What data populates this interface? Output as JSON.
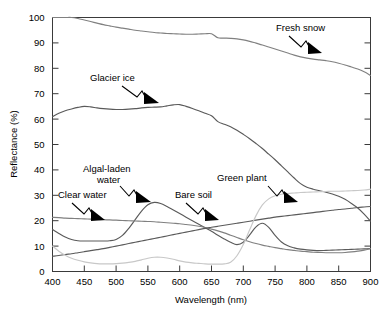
{
  "chart_data": {
    "type": "line",
    "title": "",
    "xlabel": "Wavelength (nm)",
    "ylabel": "Reflectance (%)",
    "xlim": [
      400,
      900
    ],
    "ylim": [
      0,
      100
    ],
    "xticks": [
      400,
      450,
      500,
      550,
      600,
      650,
      700,
      750,
      800,
      850,
      900
    ],
    "yticks": [
      0,
      10,
      20,
      30,
      40,
      50,
      60,
      70,
      80,
      90,
      100
    ],
    "xtick_labels": [
      "400",
      "450",
      "500",
      "550",
      "600",
      "650",
      "700",
      "750",
      "800",
      "850",
      "900"
    ],
    "ytick_labels": [
      "0",
      "10",
      "20",
      "30",
      "40",
      "50",
      "60",
      "70",
      "80",
      "90",
      "100"
    ],
    "grid": false,
    "legend_position": "inline-annotations",
    "x": [
      400,
      410,
      420,
      430,
      440,
      450,
      460,
      470,
      480,
      490,
      500,
      510,
      520,
      530,
      540,
      550,
      560,
      570,
      580,
      590,
      600,
      610,
      620,
      630,
      640,
      650,
      660,
      670,
      680,
      690,
      700,
      710,
      720,
      730,
      740,
      750,
      760,
      770,
      780,
      790,
      800,
      810,
      820,
      830,
      840,
      850,
      860,
      870,
      880,
      890,
      900
    ],
    "series": [
      {
        "name": "Fresh snow",
        "color": "#808080",
        "values": [
          100,
          100,
          100,
          100,
          99.6,
          99.0,
          98.4,
          97.8,
          97.2,
          96.7,
          96.2,
          95.8,
          95.4,
          95.0,
          94.7,
          94.4,
          94.1,
          93.9,
          93.7,
          93.6,
          93.5,
          93.4,
          93.4,
          93.5,
          93.6,
          93.6,
          92.0,
          91.9,
          91.8,
          91.6,
          91.2,
          90.6,
          89.9,
          89.2,
          88.4,
          87.6,
          86.8,
          86.0,
          85.2,
          84.5,
          84.0,
          83.6,
          83.3,
          83.0,
          82.6,
          82.0,
          81.3,
          80.5,
          79.7,
          78.6,
          77.2
        ]
      },
      {
        "name": "Glacier ice",
        "color": "#5a5a5a",
        "values": [
          61.0,
          62.3,
          63.3,
          64.0,
          64.6,
          65.0,
          64.8,
          64.4,
          64.1,
          63.9,
          63.8,
          63.8,
          63.9,
          64.1,
          64.4,
          64.6,
          64.7,
          64.8,
          65.2,
          65.6,
          65.7,
          65.0,
          64.2,
          63.3,
          62.3,
          61.3,
          59.0,
          58.0,
          57.0,
          55.6,
          54.0,
          52.3,
          50.4,
          48.4,
          46.2,
          44.0,
          41.6,
          39.2,
          36.8,
          34.6,
          33.2,
          32.4,
          31.8,
          31.2,
          30.5,
          29.6,
          28.4,
          26.8,
          25.0,
          22.6,
          19.8
        ]
      },
      {
        "name": "Algal-laden water",
        "color": "#5a5a5a",
        "values": [
          16.5,
          15.0,
          13.6,
          12.6,
          12.1,
          12.0,
          12.0,
          12.0,
          12.0,
          12.1,
          12.6,
          14.2,
          17.0,
          20.4,
          23.8,
          26.3,
          27.2,
          26.8,
          25.6,
          24.2,
          22.8,
          21.4,
          20.0,
          18.6,
          17.2,
          15.8,
          14.3,
          12.8,
          11.5,
          10.6,
          11.5,
          14.4,
          17.6,
          19.0,
          17.4,
          14.2,
          11.6,
          10.1,
          9.3,
          8.8,
          8.5,
          8.3,
          8.2,
          8.3,
          8.4,
          8.5,
          8.6,
          8.7,
          8.8,
          8.9,
          9.0
        ]
      },
      {
        "name": "Clear water",
        "color": "#808080",
        "values": [
          21.3,
          21.2,
          21.0,
          20.9,
          20.8,
          20.7,
          20.6,
          20.5,
          20.4,
          20.3,
          20.2,
          20.1,
          20.0,
          19.9,
          19.8,
          19.7,
          19.6,
          19.4,
          19.2,
          19.0,
          18.8,
          18.5,
          18.2,
          17.8,
          17.3,
          16.7,
          16.0,
          15.2,
          14.3,
          13.4,
          12.5,
          11.7,
          11.0,
          10.4,
          9.9,
          9.4,
          9.0,
          8.6,
          8.3,
          8.0,
          7.8,
          7.6,
          7.5,
          7.4,
          7.4,
          7.4,
          7.5,
          7.7,
          8.0,
          8.4,
          9.0
        ]
      },
      {
        "name": "Bare soil",
        "color": "#5a5a5a",
        "values": [
          6.0,
          6.3,
          6.7,
          7.0,
          7.4,
          7.8,
          8.2,
          8.6,
          9.0,
          9.5,
          10.0,
          10.5,
          11.0,
          11.5,
          12.0,
          12.5,
          13.0,
          13.5,
          14.0,
          14.5,
          15.0,
          15.5,
          16.0,
          16.5,
          17.0,
          17.4,
          17.8,
          18.2,
          18.6,
          19.0,
          19.4,
          19.8,
          20.2,
          20.6,
          21.0,
          21.4,
          21.7,
          22.0,
          22.3,
          22.6,
          22.9,
          23.2,
          23.5,
          23.8,
          24.1,
          24.4,
          24.6,
          24.9,
          25.2,
          25.4,
          25.6
        ]
      },
      {
        "name": "Green plant",
        "color": "#c8c8c8",
        "values": [
          10.0,
          8.0,
          6.4,
          5.2,
          4.4,
          3.8,
          3.4,
          3.1,
          3.0,
          3.0,
          3.1,
          3.3,
          3.6,
          4.0,
          4.6,
          5.2,
          5.6,
          5.6,
          5.3,
          4.8,
          4.2,
          3.7,
          3.4,
          3.2,
          3.0,
          2.9,
          2.9,
          3.0,
          3.6,
          6.2,
          10.6,
          16.4,
          22.0,
          26.2,
          28.6,
          29.8,
          30.4,
          30.7,
          30.9,
          31.1,
          31.2,
          31.3,
          31.4,
          31.5,
          31.6,
          31.6,
          31.7,
          31.8,
          31.9,
          32.1,
          32.4
        ]
      }
    ],
    "annotations": [
      {
        "text": "Fresh snow",
        "label_x": 276,
        "label_y": 31
      },
      {
        "text": "Glacier ice",
        "label_x": 90,
        "label_y": 81
      },
      {
        "text": "Algal-laden",
        "label_x": 83,
        "label_y": 172
      },
      {
        "text": "water",
        "label_x": 97,
        "label_y": 183
      },
      {
        "text": "Clear water",
        "label_x": 58,
        "label_y": 198
      },
      {
        "text": "Bare soil",
        "label_x": 175,
        "label_y": 198
      },
      {
        "text": "Green plant",
        "label_x": 217,
        "label_y": 181
      }
    ]
  }
}
